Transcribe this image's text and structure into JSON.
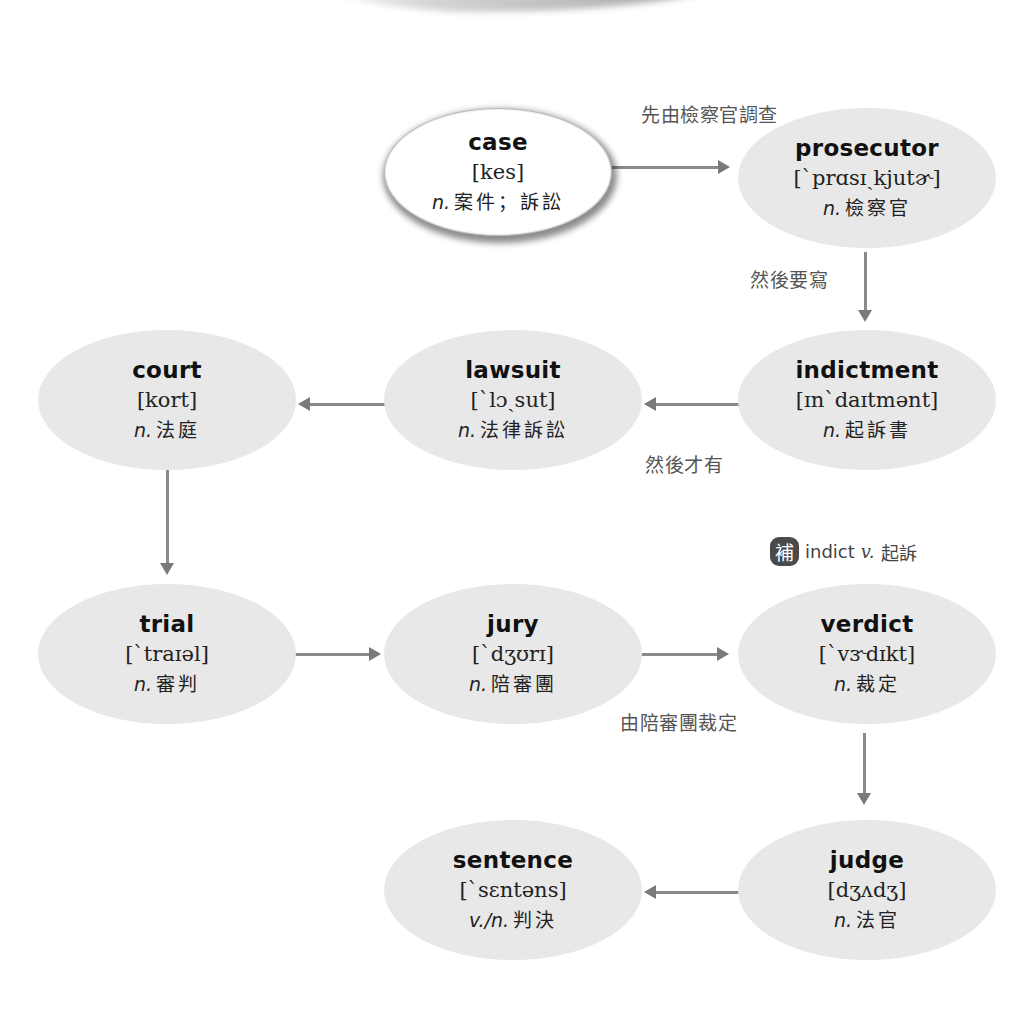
{
  "nodes": {
    "case": {
      "word": "case",
      "ipa": "[kes]",
      "pos": "n.",
      "def": "案件；訴訟"
    },
    "prosecutor": {
      "word": "prosecutor",
      "ipa": "[`prɑsɪˏkjutɚ]",
      "pos": "n.",
      "def": "檢察官"
    },
    "indictment": {
      "word": "indictment",
      "ipa": "[ɪn`daɪtmənt]",
      "pos": "n.",
      "def": "起訴書"
    },
    "lawsuit": {
      "word": "lawsuit",
      "ipa": "[`lɔˏsut]",
      "pos": "n.",
      "def": "法律訴訟"
    },
    "court": {
      "word": "court",
      "ipa": "[kort]",
      "pos": "n.",
      "def": "法庭"
    },
    "trial": {
      "word": "trial",
      "ipa": "[`traɪəl]",
      "pos": "n.",
      "def": "審判"
    },
    "jury": {
      "word": "jury",
      "ipa": "[`dʒʊrɪ]",
      "pos": "n.",
      "def": "陪審團"
    },
    "verdict": {
      "word": "verdict",
      "ipa": "[`vɝdɪkt]",
      "pos": "n.",
      "def": "裁定"
    },
    "judge": {
      "word": "judge",
      "ipa": "[dʒʌdʒ]",
      "pos": "n.",
      "def": "法官"
    },
    "sentence": {
      "word": "sentence",
      "ipa": "[`sɛntəns]",
      "pos": "v./n.",
      "def": "判決"
    }
  },
  "captions": {
    "case_to_prosecutor": "先由檢察官調查",
    "prosecutor_to_indictment": "然後要寫",
    "indictment_to_lawsuit": "然後才有",
    "jury_to_verdict": "由陪審團裁定"
  },
  "note": {
    "badge": "補",
    "word": "indict",
    "pos": "v.",
    "def": "起訴"
  },
  "edges": [
    {
      "from": "case",
      "to": "prosecutor"
    },
    {
      "from": "prosecutor",
      "to": "indictment"
    },
    {
      "from": "indictment",
      "to": "lawsuit"
    },
    {
      "from": "lawsuit",
      "to": "court"
    },
    {
      "from": "court",
      "to": "trial"
    },
    {
      "from": "trial",
      "to": "jury"
    },
    {
      "from": "jury",
      "to": "verdict"
    },
    {
      "from": "verdict",
      "to": "judge"
    },
    {
      "from": "judge",
      "to": "sentence"
    }
  ],
  "colors": {
    "node_fill": "#e8e8e8",
    "highlight_fill": "#ffffff",
    "arrow": "#8a8a8a",
    "caption": "#555555",
    "badge": "#4a4a4a"
  }
}
